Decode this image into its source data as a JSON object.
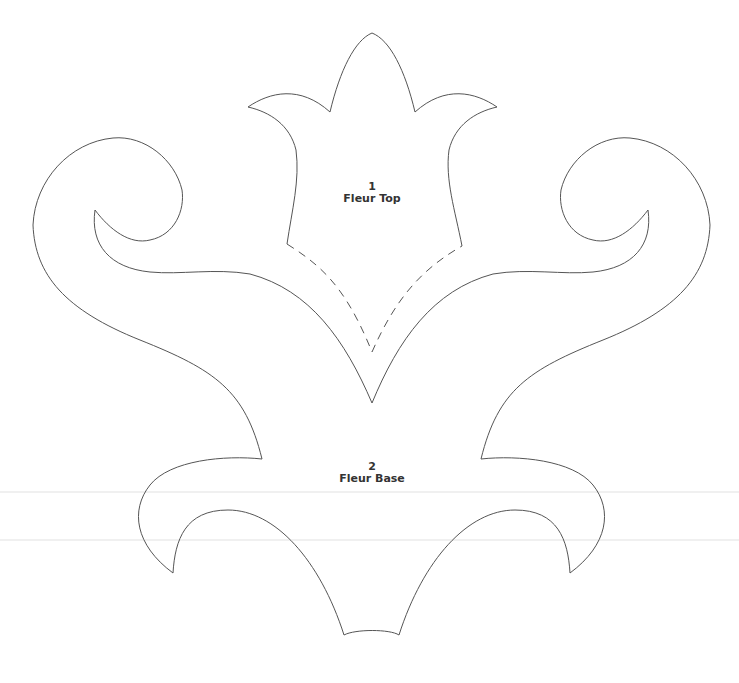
{
  "pattern": {
    "stroke_color": "#555555",
    "background": "#ffffff",
    "guide_color": "#eeeeee",
    "pieces": [
      {
        "number": "1",
        "name": "Fleur Top"
      },
      {
        "number": "2",
        "name": "Fleur Base"
      }
    ]
  }
}
